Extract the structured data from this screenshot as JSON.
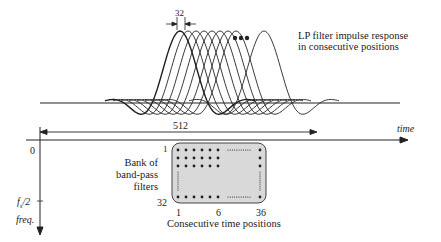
{
  "diagram": {
    "title_label": {
      "line1": "LP filter impulse response",
      "line2": "in consecutive positions"
    },
    "shift_label": "32",
    "span_label": "512",
    "ellipsis": "•••",
    "time_axis": {
      "label": "time",
      "origin": "0"
    },
    "freq_axis": {
      "label": "freq.",
      "nyquist_tick": "fs/2",
      "nyquist_tick_base": "f",
      "nyquist_tick_sub": "s",
      "nyquist_tick_rest": "/2"
    },
    "filter_bank": {
      "label_line1": "Bank of",
      "label_line2": "band-pass",
      "label_line3": "filters",
      "row_first": "1",
      "row_last": "32",
      "col_first": "1",
      "col_mid": "6",
      "col_last": "36",
      "xlabel": "Consecutive time positions",
      "fill_color": "#d9d9d9",
      "border_color": "#444444"
    },
    "colors": {
      "ink": "#222222",
      "background": "#ffffff"
    }
  }
}
